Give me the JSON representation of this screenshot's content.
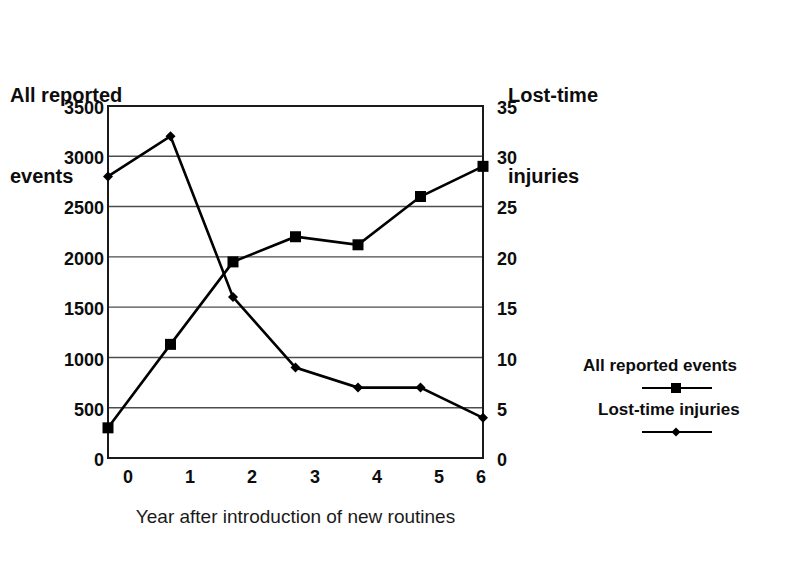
{
  "chart_data": {
    "type": "line",
    "title": "",
    "xlabel": "Year after introduction of new routines",
    "x": [
      0,
      1,
      2,
      3,
      4,
      5,
      6
    ],
    "x_tick_labels": [
      "0",
      "1",
      "2",
      "3",
      "4",
      "5",
      "6"
    ],
    "grid": true,
    "legend_position": "right",
    "axes": {
      "left": {
        "title": "All reported\nevents",
        "title_line1": "All reported",
        "title_line2": "events",
        "ylim": [
          0,
          3500
        ],
        "ticks": [
          0,
          500,
          1000,
          1500,
          2000,
          2500,
          3000,
          3500
        ],
        "tick_labels": [
          "0",
          "500",
          "1000",
          "1500",
          "2000",
          "2500",
          "3000",
          "3500"
        ]
      },
      "right": {
        "title": "Lost-time\ninjuries",
        "title_line1": "Lost-time",
        "title_line2": "injuries",
        "ylim": [
          0,
          35
        ],
        "ticks": [
          0,
          5,
          10,
          15,
          20,
          25,
          30,
          35
        ],
        "tick_labels": [
          "0",
          "5",
          "10",
          "15",
          "20",
          "25",
          "30",
          "35"
        ]
      }
    },
    "series": [
      {
        "name": "All reported events",
        "axis": "left",
        "marker": "square",
        "color": "#000000",
        "values": [
          300,
          1130,
          1950,
          2200,
          2120,
          2600,
          2900
        ]
      },
      {
        "name": "Lost-time injuries",
        "axis": "right",
        "marker": "diamond",
        "color": "#000000",
        "values": [
          28,
          32,
          16,
          9,
          7,
          7,
          4
        ]
      }
    ],
    "legend": [
      {
        "label": "All reported events",
        "marker": "square"
      },
      {
        "label": "Lost-time injuries",
        "marker": "diamond"
      }
    ]
  },
  "colors": {
    "background": "#ffffff",
    "line": "#000000",
    "grid": "#4d4d4d",
    "frame": "#1a1a1a",
    "text": "#0d0d0d"
  }
}
